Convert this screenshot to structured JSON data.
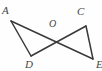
{
  "figure": {
    "type": "geometry-diagram",
    "background_color": "#fefefe",
    "stroke_color": "#3a3a3a",
    "label_color": "#454545",
    "stroke_width": 1.5,
    "points": [
      {
        "id": "A",
        "label": "A",
        "x": 11,
        "y": 21,
        "label_x": 2,
        "label_y": 5
      },
      {
        "id": "C",
        "label": "C",
        "x": 86,
        "y": 26,
        "label_x": 77,
        "label_y": 6
      },
      {
        "id": "O",
        "label": "O",
        "x": 55,
        "y": 37,
        "label_x": 49,
        "label_y": 18
      },
      {
        "id": "D",
        "label": "D",
        "x": 31,
        "y": 56,
        "label_x": 25,
        "label_y": 59
      },
      {
        "id": "E",
        "label": "E",
        "x": 93,
        "y": 59,
        "label_x": 96,
        "label_y": 59
      }
    ],
    "segments": [
      {
        "id": "A-E",
        "from": "A",
        "to": "E",
        "x1": 11,
        "y1": 21,
        "x2": 93,
        "y2": 59
      },
      {
        "id": "A-D",
        "from": "A",
        "to": "D",
        "x1": 11,
        "y1": 21,
        "x2": 31,
        "y2": 56
      },
      {
        "id": "D-C",
        "from": "D",
        "to": "C",
        "x1": 31,
        "y1": 56,
        "x2": 86,
        "y2": 26
      },
      {
        "id": "C-E",
        "from": "C",
        "to": "E",
        "x1": 86,
        "y1": 26,
        "x2": 93,
        "y2": 59
      }
    ]
  }
}
